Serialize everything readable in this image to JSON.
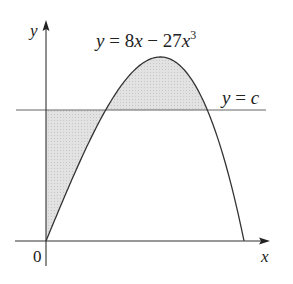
{
  "figure": {
    "equation_label": {
      "y": "y",
      "eq": " = 8",
      "x1": "x",
      "minus": " − 27",
      "x2": "x",
      "exp": "3"
    },
    "line_label": {
      "y": "y",
      "eq": " = ",
      "c": "c"
    },
    "axis_labels": {
      "x": "x",
      "y": "y",
      "origin": "0"
    },
    "colors": {
      "curve": "#333333",
      "axes": "#333333",
      "shade": "#d9d9d9",
      "hline": "#555555"
    }
  },
  "diagram_data": {
    "curve": "y = 8x - 27x^3",
    "horizontal_line": "y = c",
    "c_value_approx": 1.19,
    "x_root": 0.5443,
    "x_max": 0.3143,
    "y_max": 1.676,
    "shaded_regions": [
      "between y-axis, line y=c and curve (left, below y=c)",
      "between curve and line y=c (above y=c)"
    ]
  }
}
